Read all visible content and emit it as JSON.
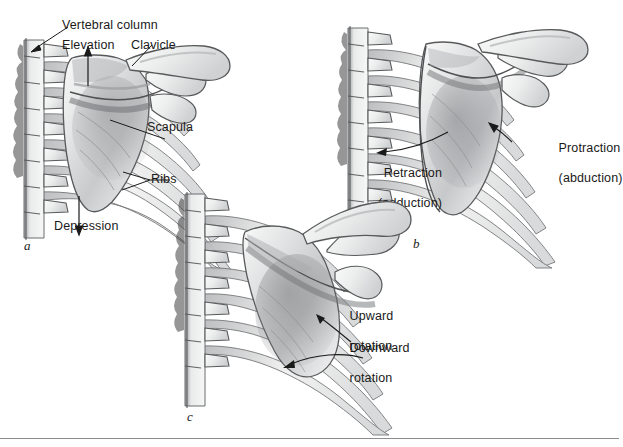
{
  "figure": {
    "background_color": "#ffffff",
    "ink_color": "#1a1a1a",
    "rule_color": "#8a8a8f",
    "panel_count": 3
  },
  "panels": [
    {
      "id": "a",
      "letter": "a",
      "movement_pair": "Elevation and depression",
      "labels": [
        {
          "key": "vertebral_column",
          "text": "Vertebral column",
          "pointer": "line"
        },
        {
          "key": "elevation",
          "text": "Elevation",
          "pointer": "arrow-up"
        },
        {
          "key": "clavicle",
          "text": "Clavicle",
          "pointer": "line"
        },
        {
          "key": "scapula",
          "text": "Scapula",
          "pointer": "line"
        },
        {
          "key": "ribs",
          "text": "Ribs",
          "pointer": "bracket"
        },
        {
          "key": "depression",
          "text": "Depression",
          "pointer": "arrow-down"
        }
      ]
    },
    {
      "id": "b",
      "letter": "b",
      "movement_pair": "Protraction and retraction",
      "labels": [
        {
          "key": "protraction",
          "text": "Protraction",
          "text2": "(abduction)",
          "pointer": "arrow"
        },
        {
          "key": "retraction",
          "text": "Retraction",
          "text2": "(adduction)",
          "pointer": "arrow"
        }
      ]
    },
    {
      "id": "c",
      "letter": "c",
      "movement_pair": "Upward and downward rotation",
      "labels": [
        {
          "key": "upward_rotation",
          "text": "Upward",
          "text2": "rotation",
          "pointer": "arrow"
        },
        {
          "key": "downward_rotation",
          "text": "Downward",
          "text2": "rotation",
          "pointer": "arrow"
        }
      ]
    }
  ],
  "anatomy": {
    "structures": [
      "vertebral column",
      "ribs",
      "scapula",
      "clavicle",
      "acromion",
      "coracoid process",
      "spine of scapula"
    ],
    "view": "posterior",
    "style": "grayscale pencil/airbrush medical illustration"
  }
}
